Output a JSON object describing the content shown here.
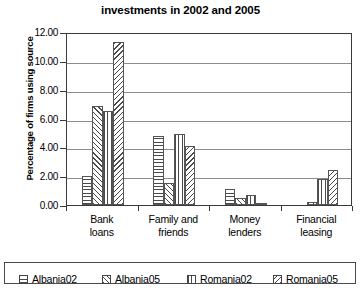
{
  "chart_data": {
    "type": "bar",
    "title": "investments in 2002 and 2005",
    "xlabel": "",
    "ylabel": "Percentage of firms using source",
    "categories": [
      "Bank loans",
      "Family and friends",
      "Money lenders",
      "Financial leasing"
    ],
    "category_lines": [
      [
        "Bank",
        "loans"
      ],
      [
        "Family and",
        "friends"
      ],
      [
        "Money",
        "lenders"
      ],
      [
        "Financial",
        "leasing"
      ]
    ],
    "series": [
      {
        "name": "Albania02",
        "pattern": "horizontal-hatch",
        "values": [
          2.0,
          4.8,
          1.1,
          0.0
        ]
      },
      {
        "name": "Albania05",
        "pattern": "forward-diagonal-hatch",
        "values": [
          6.9,
          1.5,
          0.5,
          0.2
        ]
      },
      {
        "name": "Romania02",
        "pattern": "vertical-hatch",
        "values": [
          6.5,
          4.9,
          0.7,
          1.8
        ]
      },
      {
        "name": "Romania05",
        "pattern": "backward-diagonal-hatch",
        "values": [
          11.3,
          4.1,
          0.15,
          2.4
        ]
      }
    ],
    "ylim": [
      0.0,
      12.0
    ],
    "ytick_values": [
      12.0,
      10.0,
      8.0,
      6.0,
      4.0,
      2.0,
      0.0
    ],
    "ytick_labels": [
      "12.00",
      "10.00",
      "8.00",
      "6.00",
      "4.00",
      "2.00",
      "0.00"
    ],
    "grid": true,
    "legend_position": "bottom",
    "legend_entries": [
      "Albania02",
      "Albania05",
      "Romania02",
      "Romania05"
    ],
    "colors": {
      "background": "#ffffff",
      "axis": "#3a3a3a",
      "gridline": "#8c8c8c",
      "hatch": "#4a4a4a",
      "text": "#000000"
    }
  }
}
